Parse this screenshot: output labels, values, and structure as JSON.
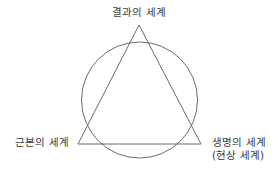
{
  "figure": {
    "background_color": "#ffffff",
    "stroke_color": "#6b6b6b",
    "text_color": "#3a3a3a",
    "width": 278,
    "height": 178
  },
  "diagram": {
    "type": "triangle-in-circle",
    "circle": {
      "center_x": 139.5,
      "center_y": 100,
      "radius": 58
    },
    "triangle": {
      "apex_x": 139,
      "apex_y": 25,
      "left_x": 78,
      "left_y": 144,
      "right_x": 201,
      "right_y": 144
    }
  },
  "labels": {
    "top": "결과의 세계",
    "bottom_left": "근본의 세계",
    "bottom_right_line1": "생명의 세계",
    "bottom_right_line2": "(현상 세계)"
  }
}
